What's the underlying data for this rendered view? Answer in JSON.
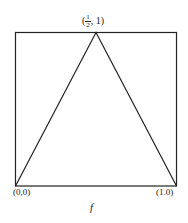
{
  "diagram": {
    "apex_label": {
      "open": "(",
      "num": "1",
      "den": "2",
      "rest": ", 1)"
    },
    "bottom_left_label": "(0,0)",
    "bottom_right_label": "(1.0)",
    "caption": "f",
    "line_color": "#222222"
  }
}
